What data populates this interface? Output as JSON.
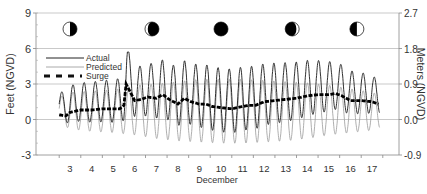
{
  "chart_data": {
    "type": "line",
    "title": "",
    "xlabel": "December",
    "ylabel": "Feet (NGVD)",
    "ylabel_right": "Meters (NGVD)",
    "ylim": [
      -3,
      9
    ],
    "ylim_right": [
      -0.9,
      2.7
    ],
    "yticks": [
      -3,
      0,
      3,
      6,
      9
    ],
    "yticks_right": [
      "-0.9",
      "0.0",
      "0.9",
      "1.8",
      "2.7"
    ],
    "x_tick_labels": [
      "3",
      "4",
      "5",
      "6",
      "7",
      "8",
      "9",
      "10",
      "11",
      "12",
      "13",
      "14",
      "15",
      "16",
      "17"
    ],
    "x_range_days": [
      1.5,
      17.8
    ],
    "grid": "horizontal",
    "legend": {
      "position": "upper-left",
      "entries": [
        {
          "name": "Actual",
          "style": "solid thin dark"
        },
        {
          "name": "Predicted",
          "style": "solid thin light"
        },
        {
          "name": "Surge",
          "style": "thick dashed"
        }
      ]
    },
    "moon_phases": [
      {
        "day": 3.0,
        "phase": "first-quarter"
      },
      {
        "day": 6.8,
        "phase": "waxing-gibbous"
      },
      {
        "day": 10.0,
        "phase": "full"
      },
      {
        "day": 13.3,
        "phase": "waning-gibbous"
      },
      {
        "day": 16.3,
        "phase": "last-quarter"
      }
    ],
    "series": [
      {
        "name": "Predicted",
        "description": "Semidiurnal predicted tide; daily high/low envelope (ft)",
        "days": [
          2.5,
          3,
          4,
          5,
          6,
          7,
          8,
          9,
          10,
          11,
          12,
          13,
          14,
          15,
          16,
          17,
          17.3
        ],
        "high": [
          1.9,
          2.3,
          2.4,
          2.5,
          2.9,
          3.0,
          3.2,
          3.4,
          3.4,
          3.4,
          3.3,
          3.2,
          3.1,
          2.9,
          2.6,
          2.3,
          2.1
        ],
        "low": [
          -0.3,
          -0.8,
          -1.0,
          -1.1,
          -1.3,
          -1.6,
          -1.8,
          -1.9,
          -2.0,
          -2.0,
          -1.9,
          -1.8,
          -1.6,
          -1.3,
          -1.1,
          -0.9,
          -0.7
        ]
      },
      {
        "name": "Surge",
        "days": [
          2.5,
          2.8,
          3.0,
          3.5,
          4.0,
          4.5,
          5.0,
          5.3,
          5.5,
          5.6,
          5.8,
          6.0,
          6.3,
          6.6,
          7.0,
          7.3,
          7.6,
          8.0,
          8.3,
          8.6,
          9.0,
          9.3,
          9.6,
          10.0,
          10.5,
          11.0,
          11.3,
          11.6,
          12.0,
          12.5,
          13.0,
          13.5,
          14.0,
          14.5,
          15.0,
          15.3,
          15.6,
          16.0,
          16.5,
          17.0,
          17.3
        ],
        "values": [
          0.4,
          0.3,
          0.6,
          0.8,
          0.8,
          0.9,
          0.9,
          0.9,
          1.2,
          3.0,
          2.3,
          1.6,
          1.7,
          1.9,
          1.8,
          2.1,
          1.7,
          1.3,
          1.8,
          1.5,
          1.3,
          1.3,
          1.1,
          1.0,
          0.9,
          1.1,
          1.2,
          1.2,
          1.5,
          1.6,
          1.7,
          1.8,
          2.0,
          2.1,
          2.1,
          2.2,
          2.0,
          1.6,
          1.6,
          1.5,
          1.3
        ]
      },
      {
        "name": "Actual",
        "description": "Predicted tide plus surge (ft); peak ~5.6 ft on Dec 5-6",
        "peak": 5.6
      }
    ]
  }
}
